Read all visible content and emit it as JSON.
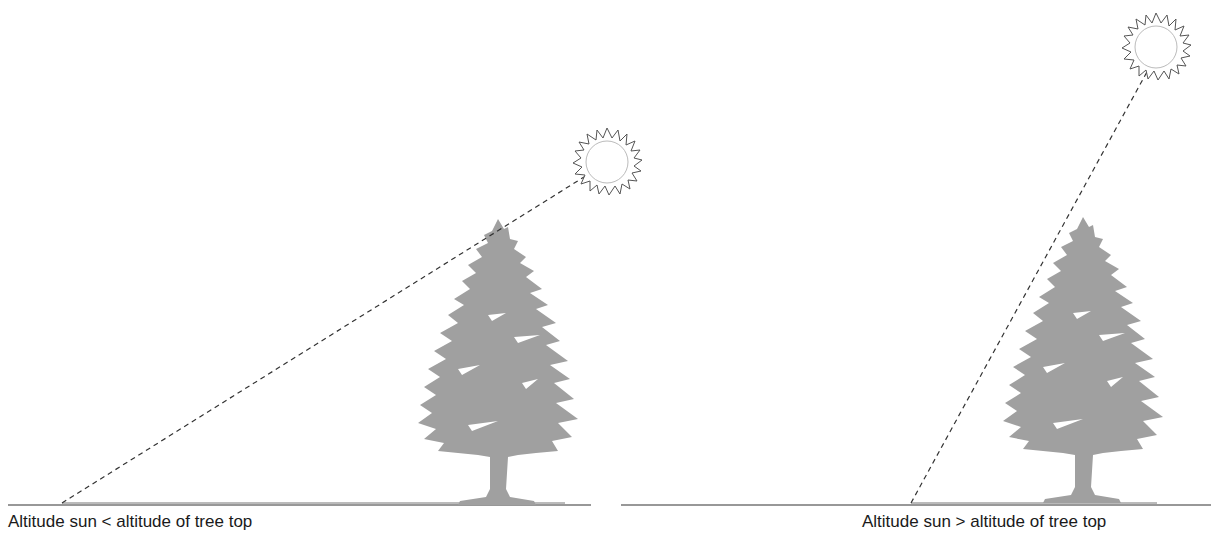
{
  "panels": [
    {
      "id": "left",
      "caption": "Altitude sun < altitude of tree top",
      "sun": {
        "cx": 607,
        "cy": 162,
        "r": 21
      },
      "sight_line": {
        "x1": 62,
        "y1": 503,
        "x2": 592,
        "y2": 172
      },
      "ground": {
        "x1": 8,
        "x2": 591,
        "y": 505
      },
      "tree": {
        "x": 418,
        "top": 222,
        "base": 503,
        "width": 160
      }
    },
    {
      "id": "right",
      "caption": "Altitude sun > altitude of tree top",
      "sun": {
        "cx": 1156,
        "cy": 47,
        "r": 21
      },
      "sight_line": {
        "x1": 911,
        "y1": 503,
        "x2": 1148,
        "y2": 68
      },
      "ground": {
        "x1": 621,
        "x2": 1211,
        "y": 505
      },
      "tree": {
        "x": 1003,
        "top": 219,
        "base": 503,
        "width": 160
      }
    }
  ],
  "colors": {
    "tree": "#a0a0a0",
    "line": "#333333",
    "sun_outline": "#555555",
    "sun_inner": "#bbbbbb"
  }
}
